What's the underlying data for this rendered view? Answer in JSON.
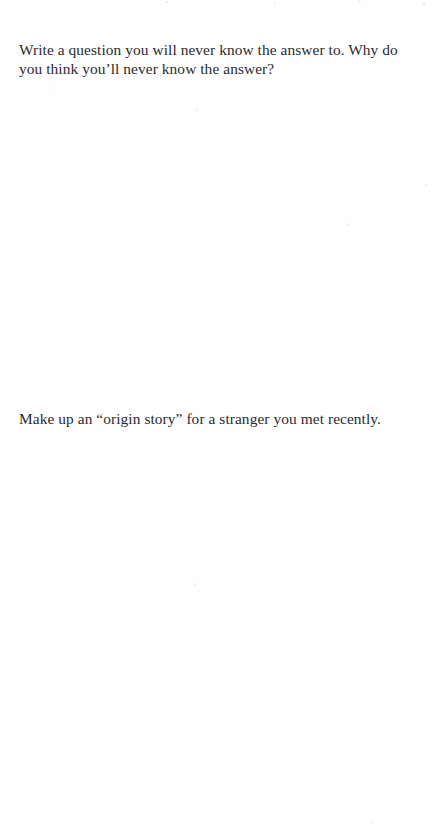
{
  "document": {
    "type": "scanned-book-page",
    "page_background": "#fefefe",
    "text_color": "#2b2b30"
  },
  "prompts": [
    {
      "id": "prompt-1",
      "text": "Write a question you will never know the answer to. Why do you think you’ll never know the answer?"
    },
    {
      "id": "prompt-2",
      "text": "Make up an “origin story” for a stranger you met recently."
    }
  ]
}
